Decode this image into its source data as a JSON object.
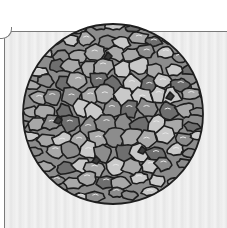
{
  "figure": {
    "center": [
      113,
      114
    ],
    "radius": 91,
    "colors": {
      "outline": "#1e1e1e",
      "light": "#c9c9c9",
      "mid_light": "#a8a8a8",
      "mid": "#8c8c8c",
      "dark": "#6e6e6e",
      "pore": "#3a3a3a",
      "panel_bg": "#eeeeee",
      "panel_border": "#7a7a7a"
    }
  }
}
